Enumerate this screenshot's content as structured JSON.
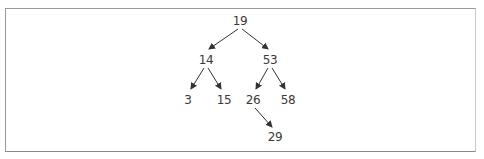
{
  "diagram": {
    "type": "binary-search-tree",
    "colors": {
      "edge": "#333333",
      "text": "#3a3a3a",
      "border": "#9a9a9a"
    },
    "nodes": [
      {
        "id": "n19",
        "label": "19",
        "x": 240,
        "y": 21
      },
      {
        "id": "n14",
        "label": "14",
        "x": 206,
        "y": 60
      },
      {
        "id": "n53",
        "label": "53",
        "x": 270,
        "y": 60
      },
      {
        "id": "n3",
        "label": "3",
        "x": 188,
        "y": 100
      },
      {
        "id": "n15",
        "label": "15",
        "x": 224,
        "y": 100
      },
      {
        "id": "n26",
        "label": "26",
        "x": 253,
        "y": 100
      },
      {
        "id": "n58",
        "label": "58",
        "x": 288,
        "y": 100
      },
      {
        "id": "n29",
        "label": "29",
        "x": 275,
        "y": 137
      }
    ],
    "edges": [
      {
        "from": "19",
        "to": "14"
      },
      {
        "from": "19",
        "to": "53"
      },
      {
        "from": "14",
        "to": "3"
      },
      {
        "from": "14",
        "to": "15"
      },
      {
        "from": "53",
        "to": "26"
      },
      {
        "from": "53",
        "to": "58"
      },
      {
        "from": "26",
        "to": "29"
      }
    ]
  }
}
